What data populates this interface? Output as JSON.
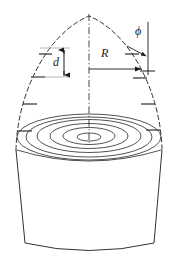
{
  "figure": {
    "background_color": "#ffffff",
    "line_color": "#1a1a1a",
    "width": 179,
    "height": 264
  },
  "labels": {
    "radius": "R",
    "spacing": "d",
    "angle": "ϕ"
  },
  "geometry": {
    "apex": {
      "x": 89,
      "y": 16
    },
    "centerline": {
      "x": 89,
      "y_top": 14,
      "y_bottom": 143
    },
    "dome": {
      "type": "parabolic-ogive",
      "left_base_x": 16,
      "right_base_x": 162,
      "base_y": 150,
      "stroke": "dashed"
    },
    "body": {
      "type": "truncated-cone",
      "top_left_x": 16,
      "top_right_x": 162,
      "top_y": 150,
      "bottom_left_x": 25,
      "bottom_right_x": 154,
      "bottom_y": 249,
      "base_curve": "ellipse-arc"
    },
    "rings": {
      "count": 6,
      "center": {
        "x": 89,
        "y": 137
      },
      "radii_x": [
        12,
        25,
        38,
        51,
        64,
        73
      ],
      "radii_y": [
        4,
        8,
        12,
        16,
        20,
        23
      ],
      "description": "concentric surface rings on dome-body junction"
    },
    "ticks": {
      "left_count": 4,
      "right_count": 4,
      "description": "short surface-normal tick marks along dome profile"
    },
    "dimension_d": {
      "x": 64,
      "y_top": 48,
      "y_bottom": 77,
      "arrow": "double-headed-vertical",
      "guide_lines": 2
    },
    "dimension_R": {
      "y": 69,
      "x_start": 89,
      "x_end": 146,
      "arrow": "right-pointing"
    },
    "dimension_phi": {
      "vertex": {
        "x": 146,
        "y": 69
      },
      "reference_line": {
        "x": 146,
        "y_top": 22,
        "y_bottom": 75
      },
      "arrow": "tangent-normal-indicator"
    }
  }
}
